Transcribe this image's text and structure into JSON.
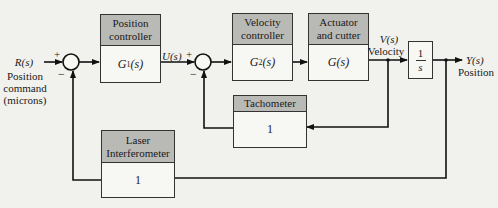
{
  "diagram": {
    "type": "block-diagram",
    "input": {
      "signal": "R(s)",
      "caption_lines": [
        "Position",
        "command",
        "(microns)"
      ]
    },
    "output": {
      "signal": "Y(s)",
      "caption": "Position"
    },
    "blocks": [
      {
        "id": "position-controller",
        "title_lines": [
          "Position",
          "controller"
        ],
        "tf": "G1(s)"
      },
      {
        "id": "velocity-controller",
        "title_lines": [
          "Velocity",
          "controller"
        ],
        "tf": "G2(s)"
      },
      {
        "id": "actuator-cutter",
        "title_lines": [
          "Actuator",
          "and cutter"
        ],
        "tf": "G(s)"
      },
      {
        "id": "integrator",
        "tf_num": "1",
        "tf_den": "s"
      },
      {
        "id": "tachometer",
        "title_lines": [
          "Tachometer"
        ],
        "tf": "1"
      },
      {
        "id": "laser-interferometer",
        "title_lines": [
          "Laser",
          "Interferometer"
        ],
        "tf": "1"
      }
    ],
    "signals": {
      "u": "U(s)",
      "v": "V(s)",
      "v_caption": "Velocity"
    },
    "summing_junctions": [
      {
        "id": "sum1",
        "plus": "+",
        "minus": "−"
      },
      {
        "id": "sum2",
        "plus": "+",
        "minus": "−"
      }
    ]
  }
}
